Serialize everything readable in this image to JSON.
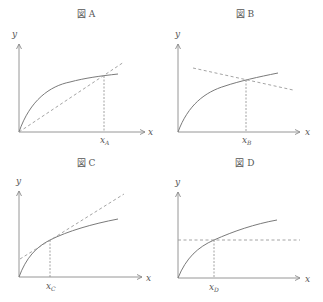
{
  "figure": {
    "panels": [
      {
        "id": "A",
        "title": "図 A",
        "y_label": "y",
        "x_label": "x",
        "marker_label": "x",
        "marker_sub": "A",
        "description": "Concave curve from origin; dashed line from origin through curve point at x_A (chord)"
      },
      {
        "id": "B",
        "title": "図 B",
        "y_label": "y",
        "x_label": "x",
        "marker_label": "x",
        "marker_sub": "B",
        "description": "Concave curve from origin; downward-sloping dashed line crossing curve at x_B"
      },
      {
        "id": "C",
        "title": "図 C",
        "y_label": "y",
        "x_label": "x",
        "marker_label": "x",
        "marker_sub": "C",
        "description": "Concave curve from origin; dashed tangent line at x_C with positive intercept"
      },
      {
        "id": "D",
        "title": "図 D",
        "y_label": "y",
        "x_label": "x",
        "marker_label": "x",
        "marker_sub": "D",
        "description": "Concave curve from origin; horizontal dashed line crossing curve at x_D"
      }
    ]
  },
  "colors": {
    "axis": "#8a8a8a",
    "curve": "#7a7a7a",
    "dashed": "#9a9a9a",
    "text": "#555555"
  }
}
